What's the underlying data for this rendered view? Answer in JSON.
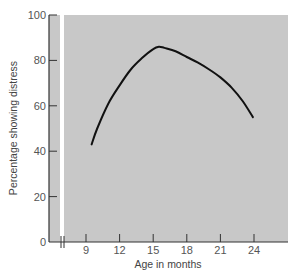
{
  "chart_data": {
    "type": "line",
    "title": "",
    "xlabel": "Age in months",
    "ylabel": "Percentage showing distress",
    "xticks": [
      9,
      12,
      15,
      18,
      21,
      24
    ],
    "yticks": [
      0,
      20,
      40,
      60,
      80,
      100
    ],
    "xlim": [
      6,
      30
    ],
    "ylim": [
      0,
      100
    ],
    "axis_break": true,
    "grid": false,
    "legend": null,
    "series": [
      {
        "name": "Separation distress",
        "x": [
          9.5,
          10,
          11,
          12,
          13,
          14,
          15,
          15.5,
          16,
          17,
          18,
          19,
          20,
          21,
          22,
          23,
          23.9
        ],
        "y": [
          43,
          50,
          61,
          69,
          76,
          81,
          85,
          86,
          85.5,
          84,
          81.5,
          79,
          76,
          72.5,
          68,
          62,
          55
        ]
      }
    ]
  },
  "colors": {
    "plot_background": "#c8c8c8",
    "axis_strip": "#c8c8c8",
    "line": "#111111",
    "axis": "#333333",
    "text": "#555555"
  }
}
